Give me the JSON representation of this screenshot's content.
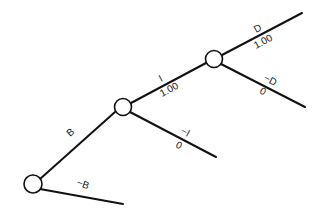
{
  "diagram": {
    "type": "decision-tree",
    "nodes": [
      {
        "id": "n1",
        "cx": 33,
        "cy": 184,
        "r": 9
      },
      {
        "id": "n2",
        "cx": 123,
        "cy": 107,
        "r": 8.5
      },
      {
        "id": "n3",
        "cx": 214,
        "cy": 59,
        "r": 8.5
      }
    ],
    "edges": [
      {
        "id": "B",
        "label": "B",
        "value": "",
        "x1": 40,
        "y1": 179,
        "x2": 115,
        "y2": 112
      },
      {
        "id": "notB",
        "label": "−B",
        "value": "",
        "x1": 40,
        "y1": 189,
        "x2": 123,
        "y2": 204
      },
      {
        "id": "I",
        "label": "I",
        "value": "1.00",
        "x1": 131,
        "y1": 103,
        "x2": 206,
        "y2": 63
      },
      {
        "id": "notI",
        "label": "−I",
        "value": "0",
        "x1": 130,
        "y1": 112,
        "x2": 216,
        "y2": 157
      },
      {
        "id": "D",
        "label": "D",
        "value": "1.00",
        "x1": 222,
        "y1": 55,
        "x2": 302,
        "y2": 13
      },
      {
        "id": "notD",
        "label": "−D",
        "value": "0",
        "x1": 221,
        "y1": 64,
        "x2": 305,
        "y2": 107
      }
    ],
    "labels": {
      "B": "B",
      "notB": "−B",
      "I": "I",
      "I_value": "1.00",
      "notI": "−I",
      "notI_value": "0",
      "D": "D",
      "D_value": "1.00",
      "notD": "−D",
      "notD_value": "0"
    }
  }
}
